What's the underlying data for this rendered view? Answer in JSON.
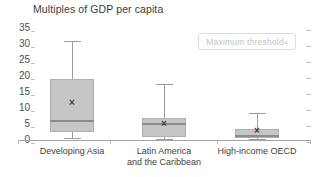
{
  "chart_data": {
    "type": "boxplot",
    "title": "Multiples of GDP per capita",
    "xlabel": "",
    "ylabel": "Multiples of GDP per capita",
    "y_axis": {
      "min": 0,
      "max": 35,
      "tick_interval": 5,
      "tick_labels": [
        "35",
        "30",
        "25",
        "20",
        "15",
        "10",
        "5",
        "0"
      ],
      "tick_values": [
        35,
        30,
        25,
        20,
        15,
        10,
        5,
        0
      ]
    },
    "grid": false,
    "legend_position": "top-right",
    "categories": [
      "Developing Asia",
      "Latin America and the Caribbean",
      "High-income OECD"
    ],
    "series": [
      {
        "name": "Developing Asia",
        "label_lines": [
          "Developing Asia"
        ],
        "whisker_low": 0.5,
        "q1": 2.5,
        "median": 6,
        "mean": 11.5,
        "q3": 19,
        "whisker_high": 31
      },
      {
        "name": "Latin America and the Caribbean",
        "label_lines": [
          "Latin America",
          "and the Caribbean"
        ],
        "whisker_low": 0.3,
        "q1": 0.8,
        "median": 5,
        "mean": 5,
        "q3": 7,
        "whisker_high": 17.5
      },
      {
        "name": "High-income OECD",
        "label_lines": [
          "High-income OECD"
        ],
        "whisker_low": 0.2,
        "q1": 0.5,
        "median": 1.2,
        "mean": 2.8,
        "q3": 3.5,
        "whisker_high": 8.5
      }
    ]
  },
  "annotation": {
    "label": "Maximum threshold",
    "footnote_marker": "a"
  },
  "colors": {
    "box_fill": "#c6c6c6",
    "box_border": "#b0b0b0",
    "median": "#8c8c8c",
    "whisker": "#9b9b9b",
    "mean_marker": "#3d3d3d",
    "axis": "#a3a3a3",
    "text": "#3f3f3f",
    "badge_border": "#dddddd",
    "badge_text": "#c5c5c5",
    "background": "#ffffff"
  }
}
